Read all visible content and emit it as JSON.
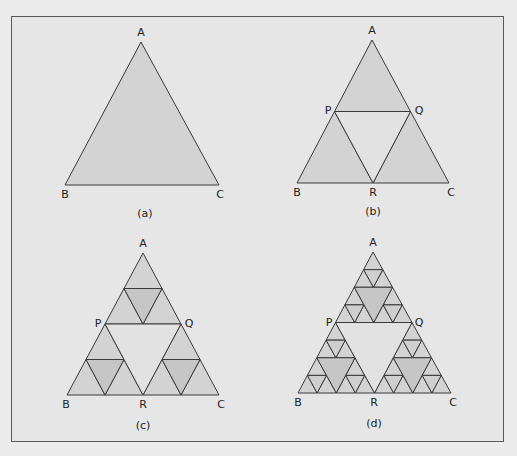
{
  "figure": {
    "colors": {
      "page_background": "#ececec",
      "frame_background": "#e6e6e6",
      "frame_border": "#5a5a5a",
      "stroke": "#3a3a3a",
      "filled": "#d3d3d3",
      "removed_center": "#e2e2e2",
      "level2_middle": "#c6c6c6",
      "level3_middle": "#cfcfcf"
    },
    "panels": [
      {
        "id": "a",
        "caption": "(a)",
        "caption_pos": [
          145,
          217
        ],
        "depth": 0,
        "vertices": {
          "A": [
            141,
            42
          ],
          "B": [
            65,
            185
          ],
          "C": [
            219,
            185
          ]
        },
        "labels": [
          {
            "text": "A",
            "pos": [
              141,
              36
            ]
          },
          {
            "text": "B",
            "pos": [
              65,
              198
            ]
          },
          {
            "text": "C",
            "pos": [
              220,
              198
            ]
          }
        ]
      },
      {
        "id": "b",
        "caption": "(b)",
        "caption_pos": [
          373,
          215
        ],
        "depth": 1,
        "vertices": {
          "A": [
            372,
            40
          ],
          "B": [
            297,
            183
          ],
          "C": [
            449,
            183
          ]
        },
        "labels": [
          {
            "text": "A",
            "pos": [
              372,
              34
            ]
          },
          {
            "text": "P",
            "pos": [
              328,
              114
            ]
          },
          {
            "text": "Q",
            "pos": [
              419,
              114
            ]
          },
          {
            "text": "B",
            "pos": [
              297,
              196
            ]
          },
          {
            "text": "R",
            "pos": [
              373,
              196
            ]
          },
          {
            "text": "C",
            "pos": [
              451,
              196
            ]
          }
        ]
      },
      {
        "id": "c",
        "caption": "(c)",
        "caption_pos": [
          143,
          429
        ],
        "depth": 2,
        "vertices": {
          "A": [
            143,
            253
          ],
          "B": [
            67,
            395
          ],
          "C": [
            219,
            395
          ]
        },
        "labels": [
          {
            "text": "A",
            "pos": [
              143,
              247
            ]
          },
          {
            "text": "P",
            "pos": [
              98,
              327
            ]
          },
          {
            "text": "Q",
            "pos": [
              189,
              327
            ]
          },
          {
            "text": "B",
            "pos": [
              66,
              408
            ]
          },
          {
            "text": "R",
            "pos": [
              143,
              408
            ]
          },
          {
            "text": "C",
            "pos": [
              221,
              408
            ]
          }
        ]
      },
      {
        "id": "d",
        "caption": "(d)",
        "caption_pos": [
          374,
          427
        ],
        "depth": 3,
        "vertices": {
          "A": [
            373,
            252
          ],
          "B": [
            298,
            393
          ],
          "C": [
            451,
            393
          ]
        },
        "labels": [
          {
            "text": "A",
            "pos": [
              373,
              246
            ]
          },
          {
            "text": "P",
            "pos": [
              329,
              326
            ]
          },
          {
            "text": "Q",
            "pos": [
              419,
              326
            ]
          },
          {
            "text": "B",
            "pos": [
              298,
              406
            ]
          },
          {
            "text": "R",
            "pos": [
              374,
              406
            ]
          },
          {
            "text": "C",
            "pos": [
              453,
              406
            ]
          }
        ]
      }
    ]
  }
}
